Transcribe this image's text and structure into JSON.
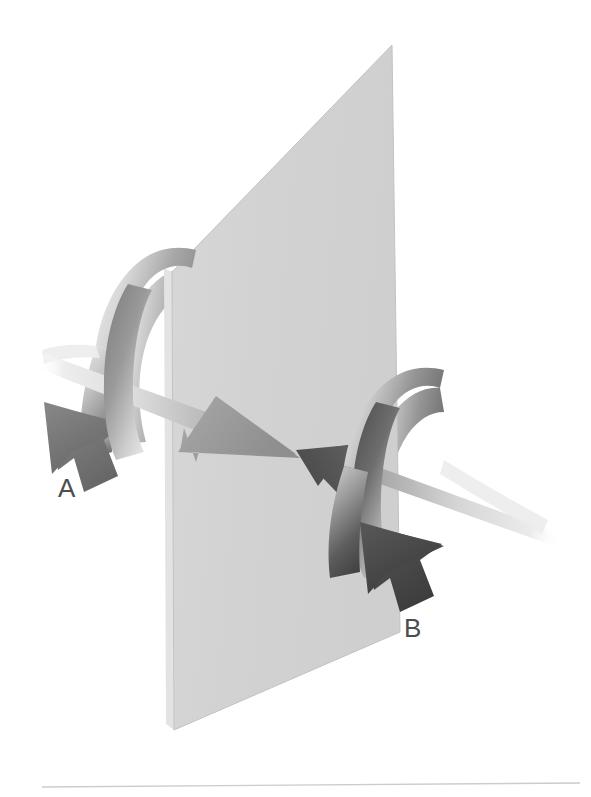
{
  "figure": {
    "type": "diagram",
    "background_color": "#ffffff",
    "footer_rule": {
      "name": "footer-rule",
      "x1": 42,
      "y1": 787,
      "x2": 580,
      "y2": 783,
      "color": "#c9ccd1",
      "width": 1.4
    },
    "plane": {
      "name": "reference-plane",
      "fill_color": "#d3d3d3",
      "edge_color": "#c2c2c2",
      "vertices": [
        {
          "x": 392,
          "y": 45
        },
        {
          "x": 400,
          "y": 632
        },
        {
          "x": 174,
          "y": 730
        },
        {
          "x": 172,
          "y": 272
        }
      ],
      "side_strip": {
        "fill_color": "#e3e3e3",
        "vertices": [
          {
            "x": 172,
            "y": 272
          },
          {
            "x": 174,
            "y": 730
          },
          {
            "x": 166,
            "y": 724
          },
          {
            "x": 164,
            "y": 268
          }
        ]
      }
    },
    "arrows": [
      {
        "name": "arrow-a",
        "label": "A",
        "label_position": {
          "x": 58,
          "y": 497
        },
        "direction": "left-to-right",
        "shaft": {
          "start": {
            "x": 36,
            "y": 352
          },
          "end": {
            "x": 248,
            "y": 430
          },
          "thickness": 17,
          "color_start": "#f4f4f4",
          "color_end": "#a9a9a9"
        },
        "head": {
          "tip": {
            "x": 290,
            "y": 452
          },
          "color": "#9c9c9c"
        },
        "rotation_ribbon": {
          "name": "rotation-ribbon-a",
          "sense": "clockwise-viewed-along-propagation",
          "color_light": "#e9e9e9",
          "color_mid": "#b5b5b5",
          "color_dark": "#6f6f6f",
          "arrowhead_color": "#6d6d6d",
          "arrowhead_tip": {
            "x": 58,
            "y": 462
          }
        }
      },
      {
        "name": "arrow-b",
        "label": "B",
        "label_position": {
          "x": 404,
          "y": 637
        },
        "direction": "right-to-left",
        "shaft": {
          "start": {
            "x": 556,
            "y": 538
          },
          "end": {
            "x": 372,
            "y": 475
          },
          "thickness": 17,
          "color_start": "#f4f4f4",
          "color_end": "#9a9a9a"
        },
        "head": {
          "tip": {
            "x": 310,
            "y": 452
          },
          "color": "#595959"
        },
        "rotation_ribbon": {
          "name": "rotation-ribbon-b",
          "sense": "clockwise-viewed-along-propagation",
          "color_light": "#e9e9e9",
          "color_mid": "#b5b5b5",
          "color_dark": "#4a4a4a",
          "arrowhead_color": "#444444",
          "arrowhead_tip": {
            "x": 378,
            "y": 568
          }
        }
      }
    ],
    "labels": [
      {
        "name": "label-a",
        "text": "A"
      },
      {
        "name": "label-b",
        "text": "B"
      }
    ]
  }
}
